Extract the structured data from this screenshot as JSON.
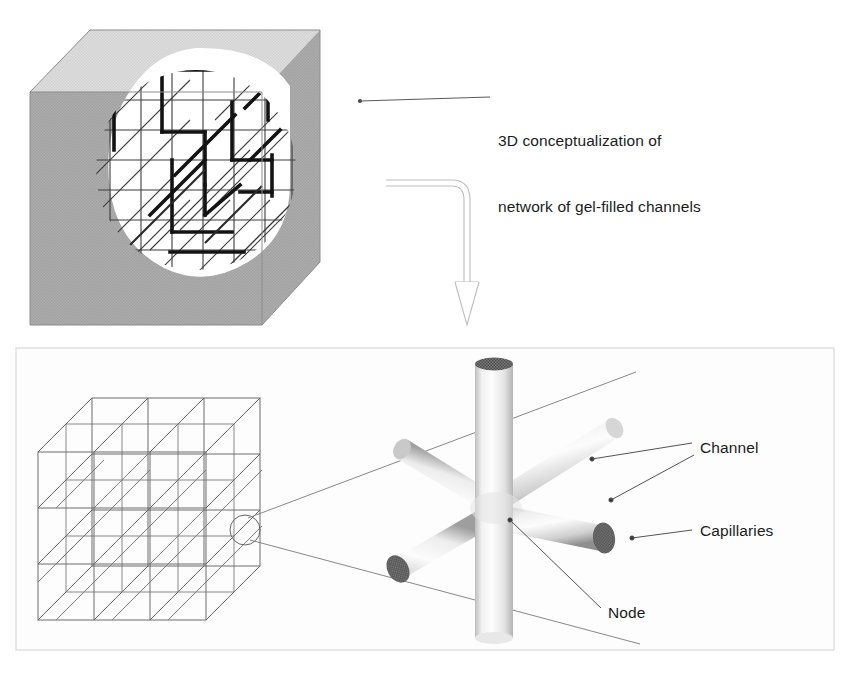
{
  "figure": {
    "background_color": "#ffffff"
  },
  "top_panel": {
    "name": "cutaway-cube-panel",
    "annotation": {
      "line1": "3D conceptualization of",
      "line2": "network of gel-filled channels"
    },
    "cube": {
      "top_face_color": "#d9d9d9",
      "front_face_color": "#a9a9a9",
      "right_face_color": "#a3a3a3",
      "cutaway_fill": "#ffffff",
      "lattice_line_color": "#3a3a3a",
      "highlight_path_color": "#111111"
    }
  },
  "flow_arrow": {
    "name": "curved-down-arrow",
    "outline_color": "#b8b8b8",
    "direction": "down"
  },
  "bottom_panel": {
    "name": "node-detail-panel",
    "border_color": "#dcdcdc",
    "background_color": "#fcfcfc",
    "lattice": {
      "name": "lattice-cube",
      "line_color": "#555555",
      "diagonal_color": "#6e6e6e",
      "grid_divisions": 3,
      "magnifier_circle_color": "#666666"
    },
    "node_diagram": {
      "name": "six-arm-node",
      "cylinder_light": "#fafafa",
      "cylinder_shade": "#8f8f8f",
      "capillary_disc_color": "#6a6a6a",
      "arms": 6
    },
    "labels": {
      "channel": "Channel",
      "capillaries": "Capillaries",
      "node": "Node"
    },
    "leader_line_color": "#4a4a4a"
  }
}
